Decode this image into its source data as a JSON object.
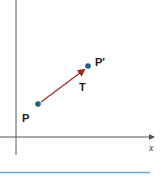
{
  "diagram": {
    "type": "translation-vector",
    "axes": {
      "x_label": "x",
      "y_label": "",
      "color": "#555555"
    },
    "points": [
      {
        "id": "P",
        "label": "P",
        "color": "#1f5f8b"
      },
      {
        "id": "P_prime",
        "label": "P′",
        "color": "#1f5f8b"
      }
    ],
    "vector": {
      "label": "T",
      "from": "P",
      "to": "P′",
      "color": "#9b2d20"
    },
    "divider": {
      "color": "#6fa8d6"
    }
  }
}
